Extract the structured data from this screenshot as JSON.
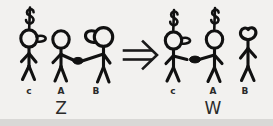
{
  "figure": {
    "type": "hand-drawn-diagram",
    "background_color": "#f2f1ef",
    "ink_color": "#111111"
  },
  "left_group": {
    "name": "state-z",
    "group_label": "Z",
    "figures": [
      {
        "id": "c",
        "label": "c",
        "has_dollar_sign": true,
        "dollar_symbol": "$",
        "head_attachment": "beak-right",
        "arms": "down",
        "connected_to": null
      },
      {
        "id": "a",
        "label": "A",
        "has_dollar_sign": false,
        "head_attachment": "none",
        "arms": "reaching-right",
        "connected_to": "b"
      },
      {
        "id": "b",
        "label": "B",
        "has_dollar_sign": false,
        "head_attachment": "blob-left",
        "arms": "reaching-left",
        "connected_to": "a"
      }
    ],
    "link_marker": "filled-dot"
  },
  "operator": {
    "name": "implies-arrow",
    "symbol": "⇒",
    "style": "double-line-arrow-right"
  },
  "right_group": {
    "name": "state-w",
    "group_label": "W",
    "figures": [
      {
        "id": "c",
        "label": "c",
        "has_dollar_sign": true,
        "dollar_symbol": "$",
        "head_attachment": "beak-right",
        "arms": "reaching-right",
        "connected_to": "a"
      },
      {
        "id": "a",
        "label": "A",
        "has_dollar_sign": true,
        "dollar_symbol": "$",
        "head_attachment": "none",
        "arms": "reaching-left",
        "connected_to": "c"
      },
      {
        "id": "b",
        "label": "B",
        "has_dollar_sign": false,
        "head_attachment": "none",
        "arms": "down",
        "connected_to": null
      }
    ],
    "link_marker": "filled-dot"
  },
  "labels": {
    "left_c": "c",
    "left_a": "A",
    "left_b": "B",
    "left_group": "Z",
    "right_c": "c",
    "right_a": "A",
    "right_b": "B",
    "right_group": "W"
  }
}
